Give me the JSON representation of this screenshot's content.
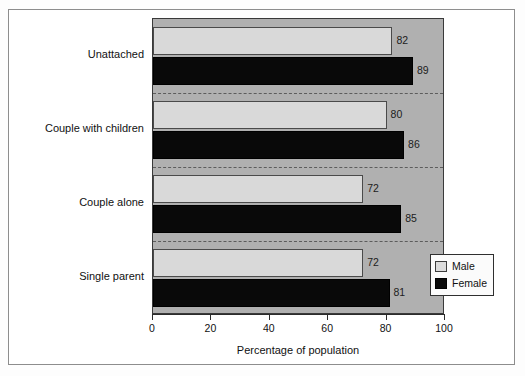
{
  "chart_data": {
    "type": "bar",
    "orientation": "horizontal",
    "title": "",
    "subtitle": "",
    "xlabel": "Percentage of population",
    "ylabel": "",
    "xlim": [
      0,
      100
    ],
    "xticks": [
      0,
      20,
      40,
      60,
      80,
      100
    ],
    "xtick_labels": [
      "0",
      "20",
      "40",
      "60",
      "80",
      "100"
    ],
    "grid": "dashed horizontal separators between category groups",
    "legend_position": "lower-right inside plot",
    "categories": [
      "Unattached",
      "Couple with children",
      "Couple alone",
      "Single parent"
    ],
    "series": [
      {
        "name": "Male",
        "color": "#d9d9d9",
        "values": [
          82,
          80,
          72,
          72
        ],
        "labels": [
          "82",
          "80",
          "72",
          "72"
        ]
      },
      {
        "name": "Female",
        "color": "#0a0a0a",
        "values": [
          89,
          86,
          85,
          81
        ],
        "labels": [
          "89",
          "86",
          "85",
          "81"
        ]
      }
    ]
  },
  "legend": {
    "items": [
      {
        "label": "Male",
        "swatch": "male"
      },
      {
        "label": "Female",
        "swatch": "female"
      }
    ]
  },
  "axis": {
    "x_title": "Percentage of population",
    "tick_labels": [
      "0",
      "20",
      "40",
      "60",
      "80",
      "100"
    ]
  },
  "categories": {
    "items": [
      {
        "label": "Unattached"
      },
      {
        "label": "Couple with children"
      },
      {
        "label": "Couple alone"
      },
      {
        "label": "Single parent"
      }
    ]
  },
  "colors": {
    "plot_background": "#b0b0b0",
    "male_bar": "#d9d9d9",
    "female_bar": "#0a0a0a",
    "frame": "#8d8d8d",
    "axis": "#2b2b2b"
  }
}
